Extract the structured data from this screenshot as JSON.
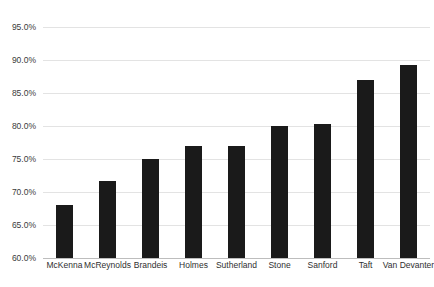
{
  "chart_data": {
    "type": "bar",
    "title": "",
    "subtitle": "",
    "xlabel": "",
    "ylabel": "",
    "categories": [
      "McKenna",
      "McReynolds",
      "Brandeis",
      "Holmes",
      "Sutherland",
      "Stone",
      "Sanford",
      "Taft",
      "Van Devanter"
    ],
    "values": [
      68.0,
      71.6,
      75.0,
      77.0,
      77.0,
      80.0,
      80.3,
      87.0,
      89.2
    ],
    "value_labels": [
      "68.0%",
      "71.6%",
      "75.0%",
      "77.0%",
      "77.0%",
      "80.0%",
      "80.3%",
      "87.0%",
      "89.2%"
    ],
    "ylim": [
      60.0,
      95.0
    ],
    "ytick_values": [
      95.0,
      90.0,
      85.0,
      80.0,
      75.0,
      70.0,
      65.0,
      60.0
    ],
    "ytick_labels": [
      "95.0%",
      "90.0%",
      "85.0%",
      "80.0%",
      "75.0%",
      "70.0%",
      "65.0%",
      "60.0%"
    ],
    "grid": "horizontal",
    "legend": "none",
    "bar_color": "#1a1a1a",
    "gridline_color": "#e3e3e3",
    "axis_color": "#bdbdbd",
    "background_color": "#ffffff"
  }
}
